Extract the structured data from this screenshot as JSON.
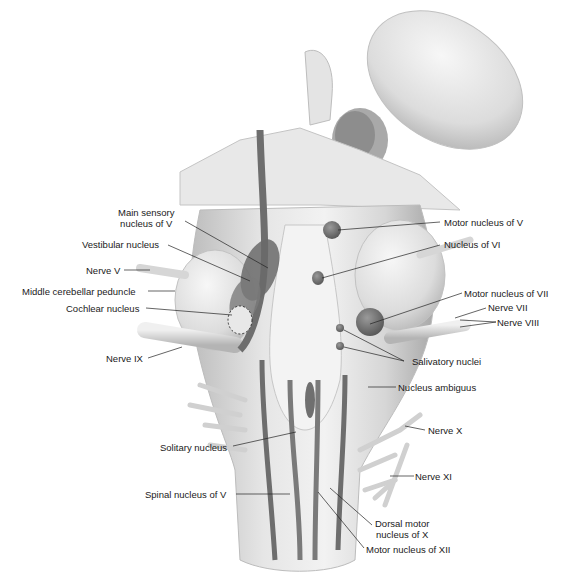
{
  "figure": {
    "colors": {
      "background": "#ffffff",
      "tissue_light": "#ececec",
      "tissue_mid": "#c8c8c8",
      "tissue_shadow": "#9a9a9a",
      "nucleus_dark": "#6a6a6a",
      "leader_line": "#222222",
      "label_text": "#1a1a1a"
    },
    "labels_left": [
      {
        "id": "main-sensory-nucleus-v",
        "line1": "Main sensory",
        "line2": "nucleus of V"
      },
      {
        "id": "vestibular-nucleus",
        "text": "Vestibular nucleus"
      },
      {
        "id": "nerve-v",
        "text": "Nerve V"
      },
      {
        "id": "middle-cerebellar-peduncle",
        "text": "Middle cerebellar peduncle"
      },
      {
        "id": "cochlear-nucleus",
        "text": "Cochlear nucleus"
      },
      {
        "id": "nerve-ix",
        "text": "Nerve IX"
      },
      {
        "id": "solitary-nucleus",
        "text": "Solitary nucleus"
      },
      {
        "id": "spinal-nucleus-v",
        "text": "Spinal nucleus of V"
      }
    ],
    "labels_right": [
      {
        "id": "motor-nucleus-v",
        "text": "Motor nucleus of V"
      },
      {
        "id": "nucleus-vi",
        "text": "Nucleus of VI"
      },
      {
        "id": "motor-nucleus-vii",
        "text": "Motor nucleus of VII"
      },
      {
        "id": "nerve-vii",
        "text": "Nerve VII"
      },
      {
        "id": "nerve-viii",
        "text": "Nerve VIII"
      },
      {
        "id": "salivatory-nuclei",
        "text": "Salivatory nuclei"
      },
      {
        "id": "nucleus-ambiguus",
        "text": "Nucleus ambiguus"
      },
      {
        "id": "nerve-x",
        "text": "Nerve X"
      },
      {
        "id": "nerve-xi",
        "text": "Nerve XI"
      },
      {
        "id": "dorsal-motor-nucleus-x",
        "line1": "Dorsal motor",
        "line2": "nucleus of X"
      },
      {
        "id": "motor-nucleus-xii",
        "text": "Motor nucleus of XII"
      }
    ]
  }
}
